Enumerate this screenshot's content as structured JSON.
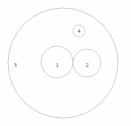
{
  "diagram": {
    "background_color": "#fefefe",
    "stroke_color": "#c9c9c9",
    "label_color": "#5a5a5a",
    "regions": [
      {
        "id": "outer",
        "label": "3",
        "label_x": 15,
        "label_y": 64,
        "cx": 63,
        "cy": 63,
        "r": 55
      },
      {
        "id": "inner-left",
        "label": "1",
        "label_x": 57,
        "label_y": 64,
        "cx": 57,
        "cy": 62,
        "r": 16
      },
      {
        "id": "inner-right",
        "label": "2",
        "label_x": 87,
        "label_y": 64,
        "cx": 87,
        "cy": 63,
        "r": 14
      },
      {
        "id": "marker-small",
        "label": "4",
        "label_x": 79,
        "label_y": 31,
        "cx": 79,
        "cy": 31,
        "r": 6
      }
    ]
  }
}
